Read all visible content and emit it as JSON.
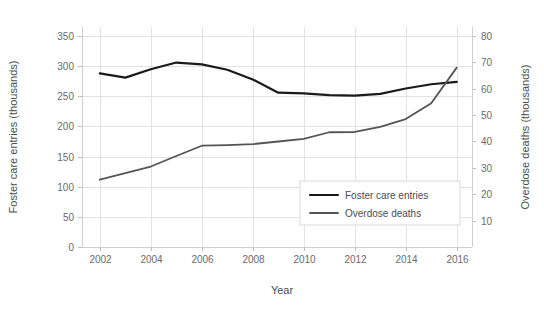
{
  "chart_data": {
    "type": "line",
    "title": "",
    "xlabel": "Year",
    "ylabel": "Foster care entries (thousands)",
    "y2label": "Overdose deaths (thousands)",
    "x": [
      2002,
      2003,
      2004,
      2005,
      2006,
      2007,
      2008,
      2009,
      2010,
      2011,
      2012,
      2013,
      2014,
      2015,
      2016
    ],
    "xlim": [
      2001.3,
      2016.6
    ],
    "xticks": [
      2002,
      2004,
      2006,
      2008,
      2010,
      2012,
      2014,
      2016
    ],
    "xticklabels": [
      "2002",
      "2004",
      "2006",
      "2008",
      "2010",
      "2012",
      "2014",
      "2016"
    ],
    "ylim": [
      0,
      365
    ],
    "yticks": [
      0,
      50,
      100,
      150,
      200,
      250,
      300,
      350
    ],
    "yticklabels": [
      "0",
      "50",
      "100",
      "150",
      "200",
      "250",
      "300",
      "350"
    ],
    "y2lim": [
      0,
      83.4
    ],
    "y2ticks": [
      10,
      20,
      30,
      40,
      50,
      60,
      70,
      80
    ],
    "y2ticklabels": [
      "10",
      "20",
      "30",
      "40",
      "50",
      "60",
      "70",
      "80"
    ],
    "grid": true,
    "legend_position": "center-right",
    "series": [
      {
        "name": "Foster care entries",
        "axis": "left",
        "color": "#1a1a1a",
        "width": 2.2,
        "values": [
          288,
          281,
          295,
          306,
          303,
          294,
          278,
          256,
          255,
          252,
          251,
          254,
          263,
          270,
          274
        ]
      },
      {
        "name": "Overdose deaths",
        "axis": "right",
        "color": "#555555",
        "width": 1.8,
        "values": [
          25.5,
          28.0,
          30.5,
          34.5,
          38.4,
          38.6,
          39.0,
          40.0,
          41.0,
          43.5,
          43.6,
          45.5,
          48.5,
          54.5,
          68.0
        ]
      }
    ]
  },
  "legend": {
    "entries": [
      {
        "label": "Foster care entries"
      },
      {
        "label": "Overdose deaths"
      }
    ]
  },
  "colors": {
    "foster_care": "#1a1a1a",
    "overdose": "#555555",
    "grid": "#e2e2e2",
    "axis": "#cfcfcf",
    "text": "#4d4d4d",
    "tick_text": "#6b6b6b",
    "background": "#ffffff"
  }
}
